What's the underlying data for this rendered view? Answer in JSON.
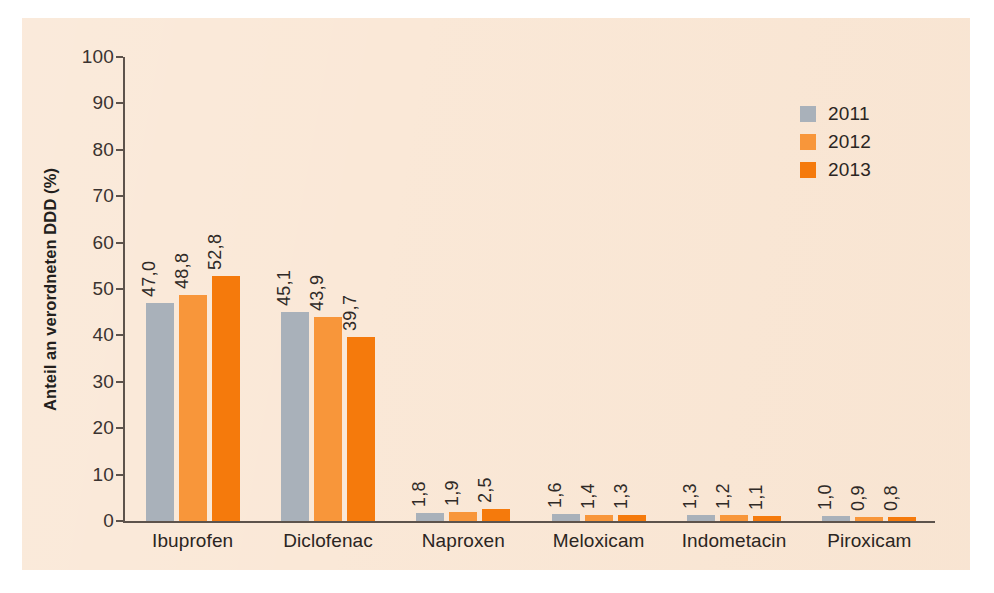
{
  "chart_data": {
    "type": "bar",
    "title": "",
    "subtitle": "",
    "xlabel": "",
    "ylabel": "Anteil an verordneten DDD (%)",
    "ylim": [
      0,
      100
    ],
    "ytick_labels": [
      "0",
      "10",
      "20",
      "30",
      "40",
      "50",
      "60",
      "70",
      "80",
      "90",
      "100"
    ],
    "ytick_values": [
      0,
      10,
      20,
      30,
      40,
      50,
      60,
      70,
      80,
      90,
      100
    ],
    "grid": false,
    "legend_position": "top-right",
    "categories": [
      "Ibuprofen",
      "Diclofenac",
      "Naproxen",
      "Meloxicam",
      "Indometacin",
      "Piroxicam"
    ],
    "series": [
      {
        "name": "2011",
        "color": "#a9b1ba",
        "values": [
          47.0,
          45.1,
          1.8,
          1.6,
          1.3,
          1.0
        ],
        "labels": [
          "47,0",
          "45,1",
          "1,8",
          "1,6",
          "1,3",
          "1,0"
        ]
      },
      {
        "name": "2012",
        "color": "#f8963a",
        "values": [
          48.8,
          43.9,
          1.9,
          1.4,
          1.2,
          0.9
        ],
        "labels": [
          "48,8",
          "43,9",
          "1,9",
          "1,4",
          "1,2",
          "0,9"
        ]
      },
      {
        "name": "2013",
        "color": "#f57a0c",
        "values": [
          52.8,
          39.7,
          2.5,
          1.3,
          1.1,
          0.8
        ],
        "labels": [
          "52,8",
          "39,7",
          "2,5",
          "1,3",
          "1,1",
          "0,8"
        ]
      }
    ]
  },
  "legend": {
    "entries": [
      {
        "label": "2011",
        "color": "#a9b1ba"
      },
      {
        "label": "2012",
        "color": "#f8963a"
      },
      {
        "label": "2013",
        "color": "#f57a0c"
      }
    ]
  },
  "colors": {
    "plot_background": "#fae8d7",
    "page_background": "#ffffff",
    "axis": "#5d534c",
    "text": "#2b2522",
    "series_2011": "#a9b1ba",
    "series_2012": "#f8963a",
    "series_2013": "#f57a0c"
  }
}
